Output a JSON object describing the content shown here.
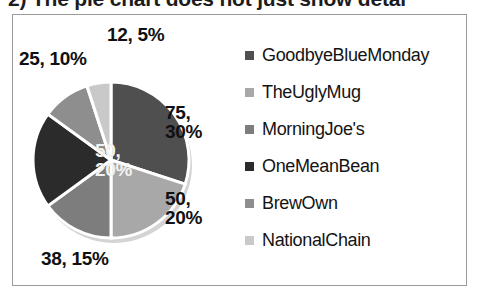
{
  "caption": {
    "text": "2) The pie chart does not just show detai"
  },
  "chart_data": {
    "type": "pie",
    "title": "",
    "legend_position": "right",
    "grid": false,
    "categories": [
      "GoodbyeBlueMonday",
      "TheUglyMug",
      "MorningJoe's",
      "OneMeanBean",
      "BrewOwn",
      "NationalChain"
    ],
    "values": [
      75,
      50,
      38,
      50,
      25,
      12
    ],
    "percentages": [
      30,
      20,
      15,
      20,
      10,
      5
    ],
    "data_labels": [
      "75,\n30%",
      "50,\n20%",
      "38, 15%",
      "50,\n20%",
      "25, 10%",
      "12, 5%"
    ],
    "colors": [
      "#4f4f4f",
      "#a8a8a8",
      "#7d7d7d",
      "#2b2b2b",
      "#8e8e8e",
      "#c9c9c9"
    ],
    "total": 250
  },
  "pie": {
    "labels": [
      {
        "name": "slice-label-goodbyebluemonday",
        "text": "75,\n30%"
      },
      {
        "name": "slice-label-theuglymug",
        "text": "50,\n20%"
      },
      {
        "name": "slice-label-morningjoes",
        "text": "38, 15%"
      },
      {
        "name": "slice-label-onemeanbean",
        "text": "50,\n20%"
      },
      {
        "name": "slice-label-brewown",
        "text": "25, 10%"
      },
      {
        "name": "slice-label-nationalchain",
        "text": "12, 5%"
      }
    ]
  },
  "legend": {
    "items": [
      {
        "label": "GoodbyeBlueMonday",
        "color": "#4f4f4f"
      },
      {
        "label": "TheUglyMug",
        "color": "#a8a8a8"
      },
      {
        "label": "MorningJoe's",
        "color": "#7d7d7d"
      },
      {
        "label": "OneMeanBean",
        "color": "#2b2b2b"
      },
      {
        "label": "BrewOwn",
        "color": "#8e8e8e"
      },
      {
        "label": "NationalChain",
        "color": "#c9c9c9"
      }
    ]
  }
}
